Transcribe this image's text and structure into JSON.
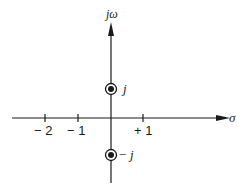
{
  "diagram": {
    "type": "s-plane pole-zero plot",
    "axes": {
      "vertical_label": "jω",
      "horizontal_label": "σ"
    },
    "ticks": [
      {
        "label": "− 2",
        "value": -2
      },
      {
        "label": "− 1",
        "value": -1
      },
      {
        "label": "+ 1",
        "value": 1
      }
    ],
    "points": [
      {
        "label": "j",
        "re": 0,
        "im": 1,
        "marker": "circled-dot"
      },
      {
        "label": "− j",
        "re": 0,
        "im": -1,
        "marker": "circled-dot"
      }
    ],
    "colors": {
      "ink": "#1a1a1a",
      "background": "#ffffff"
    }
  }
}
